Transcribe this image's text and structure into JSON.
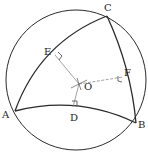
{
  "diagram": {
    "type": "spherical-triangle-circumcircle",
    "colors": {
      "stroke": "#2a2a2a",
      "construction": "#8a8a8a",
      "background": "#ffffff"
    },
    "circle": {
      "cx": 76,
      "cy": 80,
      "r": 70
    },
    "points": {
      "A": {
        "label": "A",
        "x": 15,
        "y": 111,
        "lx": 2,
        "ly": 118
      },
      "B": {
        "label": "B",
        "x": 136,
        "y": 123,
        "lx": 138,
        "ly": 128
      },
      "C": {
        "label": "C",
        "x": 107,
        "y": 16,
        "lx": 104,
        "ly": 11
      },
      "D": {
        "label": "D",
        "x": 73,
        "y": 107,
        "lx": 70,
        "ly": 121
      },
      "E": {
        "label": "E",
        "x": 55,
        "y": 55,
        "lx": 44,
        "ly": 55
      },
      "F": {
        "label": "F",
        "x": 123,
        "y": 77,
        "lx": 124,
        "ly": 76
      },
      "O": {
        "label": "O",
        "x": 79,
        "y": 84,
        "lx": 84,
        "ly": 90
      }
    },
    "arcs": [
      {
        "name": "arc-AC",
        "from": "A",
        "to": "C",
        "path": "M15,111 Q40,42 107,16"
      },
      {
        "name": "arc-CB",
        "from": "C",
        "to": "B",
        "path": "M107,16 Q131,68 136,123"
      },
      {
        "name": "arc-AB",
        "from": "A",
        "to": "B",
        "path": "M15,111 Q78,95 136,123"
      }
    ],
    "perpendiculars": [
      {
        "name": "OE",
        "from": "O",
        "to": "E"
      },
      {
        "name": "OF",
        "from": "O",
        "to": "F"
      },
      {
        "name": "OD",
        "from": "O",
        "to": "D"
      }
    ]
  }
}
